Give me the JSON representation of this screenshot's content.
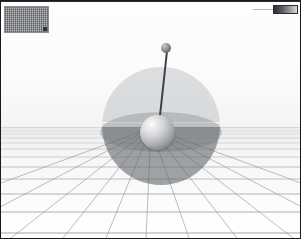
{
  "window": {
    "title": "3D Pendulum Simulation Viewport",
    "frame_color": "#1a1a1a"
  },
  "scene": {
    "name": "inverted-pendulum-scene",
    "background_color": "#ffffff",
    "sky_color": "#fbfbfb",
    "ground_color": "#f6f6f7",
    "horizon_y": 127,
    "grid": {
      "line_color": "#8e9093",
      "vanishing_point_x": 150,
      "vanishing_point_y": 127,
      "radial_line_count": 11,
      "horizontal_line_count": 13
    },
    "bounding_sphere": {
      "name": "translucent-bounding-sphere",
      "center_x": 160,
      "center_y": 125,
      "radius": 59,
      "upper_color": "#96989b",
      "upper_opacity": 0.3,
      "lower_color": "#606368",
      "lower_opacity": 0.52
    },
    "pendulum": {
      "name": "inverted-pendulum",
      "pivot": {
        "x": 157,
        "y": 132,
        "radius": 18,
        "color": "#a9abaf"
      },
      "bob": {
        "x": 166,
        "y": 48,
        "radius": 5,
        "color": "#6a6c71"
      },
      "rod": {
        "color": "#3f4146",
        "width": 2,
        "angle_deg": 6
      }
    }
  },
  "overlay": {
    "dither_panel": {
      "label": "texture-swatch",
      "x": 3,
      "y": 5,
      "width": 45,
      "height": 27,
      "color": "#b9babc"
    },
    "gradient_bar": {
      "label": "intensity-ramp",
      "x": 272,
      "y": 4,
      "width": 25,
      "height": 9,
      "from_color": "#2b2d30",
      "to_color": "#d7d8da"
    }
  }
}
